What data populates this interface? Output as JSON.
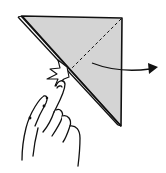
{
  "diagram": {
    "type": "origami-instruction-step",
    "description": "Hand pinches folded triangle; dashed diagonal fold line; arrow indicating fold direction to the right",
    "colors": {
      "paper": "#d4d4d4",
      "outline": "#111111",
      "background": "#ffffff"
    },
    "elements": {
      "paper_triangle": "folded square paper (triangle)",
      "fold_line": "dashed valley fold line",
      "arrow": "fold direction arrow",
      "pinch_mark": "star-shaped pinch/press mark",
      "hand": "hand holding paper"
    }
  }
}
